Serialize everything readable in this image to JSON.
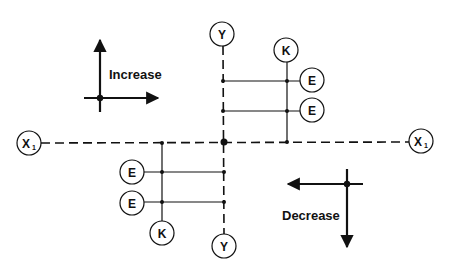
{
  "diagram": {
    "type": "axis-adjustment-diagram",
    "colors": {
      "line": "#111111",
      "background": "#ffffff"
    },
    "axes": {
      "horizontal": {
        "left_label": "X",
        "left_subscript": "1",
        "right_label": "X",
        "right_subscript": "1",
        "style": "dashed"
      },
      "vertical": {
        "top_label": "Y",
        "bottom_label": "Y",
        "style": "dashed"
      }
    },
    "upper_right_group": {
      "k_label": "K",
      "e_labels": [
        "E",
        "E"
      ]
    },
    "lower_left_group": {
      "k_label": "K",
      "e_labels": [
        "E",
        "E"
      ]
    },
    "legend": {
      "increase": {
        "label": "Increase",
        "arrows": [
          "up",
          "right"
        ]
      },
      "decrease": {
        "label": "Decrease",
        "arrows": [
          "down",
          "left"
        ]
      }
    }
  }
}
